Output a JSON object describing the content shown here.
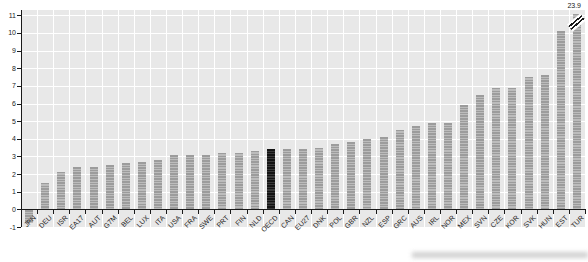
{
  "chart_data": {
    "type": "bar",
    "title": "",
    "xlabel": "",
    "ylabel": "",
    "categories": [
      "JPN",
      "DEU",
      "ISR",
      "EA17",
      "AUT",
      "G7M",
      "BEL",
      "LUX",
      "ITA",
      "USA",
      "FRA",
      "SWE",
      "PRT",
      "FIN",
      "NLD",
      "OECD",
      "CAN",
      "EU27",
      "DNK",
      "POL",
      "GBR",
      "NZL",
      "ESP",
      "GRC",
      "AUS",
      "IRL",
      "NOR",
      "MEX",
      "SVN",
      "CZE",
      "KOR",
      "SVK",
      "HUN",
      "EST",
      "TUR"
    ],
    "values": [
      -0.7,
      1.5,
      2.1,
      2.4,
      2.4,
      2.5,
      2.6,
      2.7,
      2.8,
      3.1,
      3.1,
      3.1,
      3.2,
      3.2,
      3.3,
      3.4,
      3.4,
      3.4,
      3.5,
      3.7,
      3.8,
      4.0,
      4.1,
      4.5,
      4.7,
      4.9,
      4.9,
      5.9,
      6.5,
      6.9,
      6.9,
      7.5,
      7.6,
      10.1,
      23.9
    ],
    "highlight_category": "OECD",
    "broken_bar": {
      "category": "TUR",
      "label": "23.9",
      "display_top_value": 11.1
    },
    "y_ticks": [
      -1,
      0,
      1,
      2,
      3,
      4,
      5,
      6,
      7,
      8,
      9,
      10,
      11
    ],
    "ylim": [
      -1,
      11.3
    ],
    "grid": true,
    "legend": "none",
    "colors": {
      "bar": "#9c9c9c",
      "bar_stripe": "#bcbcbc",
      "highlight_bar": "#141414",
      "plot_background": "#e8e8e8",
      "gridline": "#ffffff",
      "axis": "#1a1a1a",
      "label_text": "#222222"
    }
  }
}
